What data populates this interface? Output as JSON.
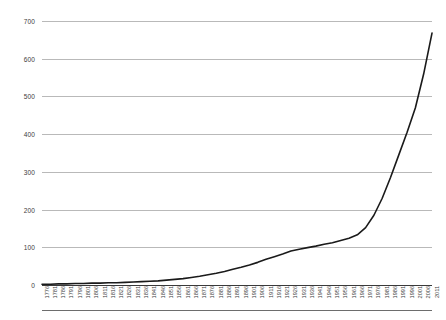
{
  "chart_data": {
    "type": "line",
    "title": "",
    "subtitle": "",
    "xlabel": "",
    "ylabel": "",
    "ylim": [
      0,
      700
    ],
    "ytick_values": [
      0,
      100,
      200,
      300,
      400,
      500,
      600,
      700
    ],
    "ytick_labels": [
      "0",
      "100",
      "200",
      "300",
      "400",
      "500",
      "600",
      "700"
    ],
    "grid": true,
    "legend": "none",
    "x": [
      1776,
      1781,
      1786,
      1791,
      1796,
      1801,
      1806,
      1811,
      1816,
      1821,
      1826,
      1831,
      1836,
      1841,
      1846,
      1851,
      1856,
      1861,
      1866,
      1871,
      1876,
      1881,
      1886,
      1891,
      1896,
      1901,
      1906,
      1911,
      1916,
      1921,
      1926,
      1931,
      1936,
      1941,
      1946,
      1951,
      1956,
      1961,
      1966,
      1971,
      1976,
      1981,
      1986,
      1991,
      1996,
      2001,
      2006,
      2011
    ],
    "xtick_labels": [
      "1776",
      "1781",
      "1786",
      "1791",
      "1796",
      "1801",
      "1806",
      "1811",
      "1816",
      "1821",
      "1826",
      "1831",
      "1836",
      "1841",
      "1846",
      "1851",
      "1856",
      "1861",
      "1866",
      "1871",
      "1876",
      "1881",
      "1886",
      "1891",
      "1896",
      "1901",
      "1906",
      "1911",
      "1916",
      "1921",
      "1926",
      "1931",
      "1936",
      "1941",
      "1946",
      "1951",
      "1956",
      "1961",
      "1966",
      "1971",
      "1976",
      "1981",
      "1986",
      "1991",
      "1996",
      "2001",
      "2006",
      "2011"
    ],
    "series": [
      {
        "name": "",
        "color": "#1a1a1a",
        "values": [
          2,
          2,
          3,
          3,
          4,
          4,
          5,
          5,
          6,
          6,
          7,
          8,
          9,
          10,
          11,
          13,
          15,
          17,
          20,
          23,
          27,
          31,
          36,
          42,
          47,
          53,
          60,
          68,
          75,
          82,
          90,
          95,
          99,
          103,
          108,
          112,
          118,
          124,
          133,
          152,
          185,
          230,
          285,
          345,
          405,
          470,
          560,
          668
        ]
      }
    ]
  }
}
